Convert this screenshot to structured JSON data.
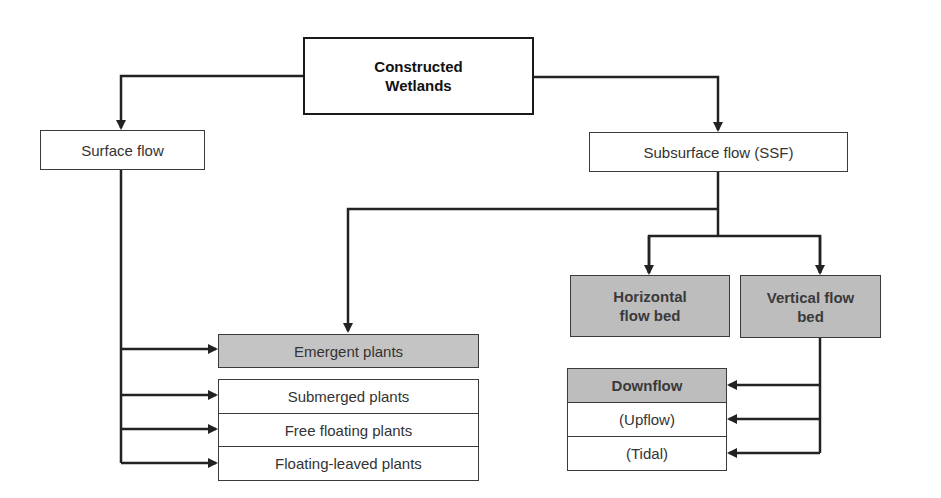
{
  "diagram": {
    "root": {
      "label_line1": "Constructed",
      "label_line2": "Wetlands"
    },
    "surface_flow": {
      "label": "Surface flow",
      "emergent": "Emergent plants",
      "others": [
        "Submerged plants",
        "Free floating plants",
        "Floating-leaved plants"
      ]
    },
    "subsurface_flow": {
      "label": "Subsurface flow (SSF)",
      "horizontal": {
        "line1": "Horizontal",
        "line2": "flow bed"
      },
      "vertical": {
        "line1": "Vertical flow",
        "line2": "bed"
      },
      "vertical_modes": [
        "Downflow",
        "(Upflow)",
        "(Tidal)"
      ]
    },
    "colors": {
      "line": "#222222",
      "highlight_fill": "#bdbdbd",
      "box_fill": "#ffffff"
    }
  }
}
